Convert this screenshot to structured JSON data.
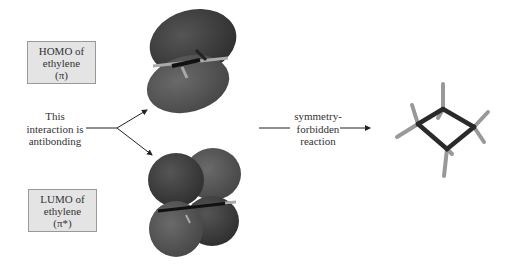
{
  "figure": {
    "homo_box": {
      "lines": [
        "HOMO of",
        "ethylene",
        "(π)"
      ]
    },
    "lumo_box": {
      "lines": [
        "LUMO of",
        "ethylene",
        "(π*)"
      ]
    },
    "interaction_label": {
      "lines": [
        "This",
        "interaction is",
        "antibonding"
      ]
    },
    "reaction_label": {
      "lines": [
        "symmetry-",
        "forbidden",
        "reaction"
      ]
    },
    "molecules": {
      "homo_orbital": "ethylene π orbital (HOMO) – two lobes above/below C=C",
      "lumo_orbital": "ethylene π* orbital (LUMO) – four lobes with nodal plane",
      "product": "cyclobutane ball-and-stick model"
    },
    "colors": {
      "box_fill": "#e4e4e4",
      "box_border": "#999999",
      "lobe_dark": "#3a3a3a",
      "lobe_light": "#5a5a5a",
      "bond": "#2a2a2a",
      "hydrogen": "#9a9a9a"
    }
  }
}
